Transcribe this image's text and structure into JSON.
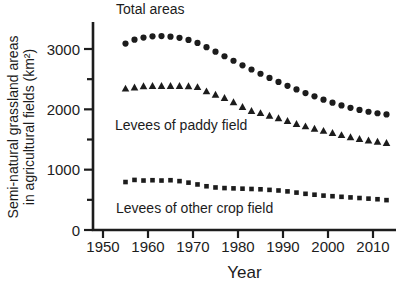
{
  "figure": {
    "background": "#ffffff",
    "ink_color": "#1c1c1c"
  },
  "chart_data": {
    "type": "scatter",
    "title": "",
    "xlabel": "Year",
    "ylabel_line1": "Semi-natural grassland areas",
    "ylabel_line2": "in agricultural fields (km²)",
    "xlim": [
      1948,
      2015
    ],
    "ylim": [
      0,
      3450
    ],
    "x_ticks": [
      1950,
      1960,
      1970,
      1980,
      1990,
      2000,
      2010
    ],
    "y_ticks_major": [
      0,
      1000,
      2000,
      3000
    ],
    "y_ticks_minor": [
      500,
      1500,
      2500
    ],
    "grid": false,
    "legend": "inline-text-annotations",
    "x": [
      1955,
      1957,
      1959,
      1961,
      1963,
      1965,
      1967,
      1969,
      1971,
      1973,
      1975,
      1977,
      1979,
      1981,
      1983,
      1985,
      1987,
      1989,
      1991,
      1993,
      1995,
      1997,
      1999,
      2001,
      2003,
      2005,
      2007,
      2009,
      2011,
      2013
    ],
    "series": [
      {
        "name": "Total areas",
        "marker": "circle",
        "color": "#1c1c1c",
        "values": [
          3090,
          3155,
          3190,
          3210,
          3215,
          3205,
          3185,
          3150,
          3100,
          3030,
          2955,
          2880,
          2805,
          2730,
          2660,
          2590,
          2520,
          2455,
          2390,
          2330,
          2270,
          2215,
          2160,
          2110,
          2065,
          2025,
          1990,
          1960,
          1935,
          1915
        ]
      },
      {
        "name": "Levees of paddy field",
        "marker": "triangle-up",
        "color": "#1c1c1c",
        "values": [
          2345,
          2365,
          2385,
          2390,
          2390,
          2390,
          2390,
          2385,
          2370,
          2300,
          2245,
          2190,
          2120,
          2040,
          1975,
          1940,
          1895,
          1855,
          1810,
          1760,
          1720,
          1680,
          1645,
          1610,
          1575,
          1540,
          1510,
          1485,
          1465,
          1445
        ]
      },
      {
        "name": "Levees of other crop field",
        "marker": "square",
        "color": "#1c1c1c",
        "values": [
          795,
          830,
          820,
          825,
          820,
          825,
          810,
          785,
          755,
          725,
          705,
          695,
          690,
          685,
          680,
          675,
          665,
          655,
          640,
          620,
          600,
          585,
          570,
          560,
          550,
          540,
          530,
          520,
          510,
          495
        ]
      }
    ],
    "annotations": [
      {
        "text": "Total areas",
        "left": 116,
        "top": 2
      },
      {
        "text": "Levees of paddy field",
        "left": 115,
        "top": 118
      },
      {
        "text": "Levees of other crop field",
        "left": 116,
        "top": 201
      }
    ]
  }
}
